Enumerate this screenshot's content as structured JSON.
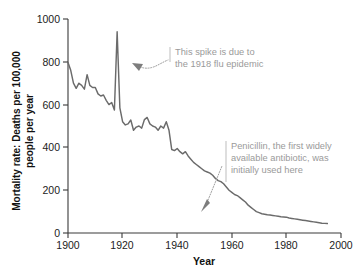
{
  "chart_data": {
    "type": "line",
    "title": "",
    "xlabel": "Year",
    "ylabel": "Mortality rate: Deaths per 100,000 people per year",
    "ylabel_line1": "Mortality rate: Deaths per 100,000",
    "ylabel_line2": "people per year",
    "xlim": [
      1900,
      2000
    ],
    "ylim": [
      0,
      1000
    ],
    "grid": false,
    "legend": "none",
    "line_color": "#6b6b6b",
    "axis_color": "#3a3a3a",
    "annotation_color": "#9a9a9a",
    "xticks": [
      1900,
      1920,
      1940,
      1960,
      1980,
      2000
    ],
    "xtick_labels": [
      "1900",
      "1920",
      "1940",
      "1960",
      "1980",
      "2000"
    ],
    "yticks": [
      0,
      200,
      400,
      600,
      800,
      1000
    ],
    "ytick_labels": [
      "0",
      "200",
      "400",
      "600",
      "800",
      "1000"
    ],
    "x": [
      1900,
      1901,
      1902,
      1903,
      1904,
      1905,
      1906,
      1907,
      1908,
      1909,
      1910,
      1911,
      1912,
      1913,
      1914,
      1915,
      1916,
      1917,
      1918,
      1919,
      1920,
      1921,
      1922,
      1923,
      1924,
      1925,
      1926,
      1927,
      1928,
      1929,
      1930,
      1931,
      1932,
      1933,
      1934,
      1935,
      1936,
      1937,
      1938,
      1939,
      1940,
      1941,
      1942,
      1943,
      1944,
      1945,
      1946,
      1947,
      1948,
      1949,
      1950,
      1951,
      1952,
      1953,
      1954,
      1955,
      1956,
      1957,
      1958,
      1959,
      1960,
      1961,
      1962,
      1963,
      1964,
      1965,
      1966,
      1967,
      1968,
      1969,
      1970,
      1971,
      1972,
      1973,
      1974,
      1975,
      1976,
      1977,
      1978,
      1979,
      1980,
      1981,
      1982,
      1983,
      1984,
      1985,
      1986,
      1987,
      1988,
      1989,
      1990,
      1991,
      1992,
      1993,
      1994,
      1995
    ],
    "values": [
      797,
      760,
      700,
      676,
      700,
      690,
      672,
      740,
      690,
      680,
      680,
      650,
      640,
      645,
      620,
      600,
      610,
      575,
      940,
      585,
      520,
      505,
      510,
      528,
      480,
      495,
      500,
      490,
      530,
      540,
      510,
      500,
      495,
      480,
      500,
      490,
      520,
      480,
      390,
      385,
      395,
      380,
      370,
      380,
      360,
      345,
      330,
      320,
      310,
      300,
      290,
      285,
      280,
      270,
      255,
      245,
      240,
      230,
      215,
      200,
      190,
      180,
      175,
      165,
      155,
      145,
      130,
      120,
      110,
      100,
      95,
      90,
      88,
      85,
      84,
      82,
      80,
      78,
      76,
      75,
      74,
      70,
      68,
      66,
      64,
      62,
      60,
      58,
      56,
      54,
      52,
      50,
      48,
      46,
      45,
      44
    ],
    "annotations": [
      {
        "id": "flu-spike-annotation",
        "line1": "This spike is due to",
        "line2": "the 1918 flu epidemic",
        "points_to_year": 1918,
        "points_to_value": 890
      },
      {
        "id": "penicillin-annotation",
        "line1": "Penicillin, the first widely",
        "line2": "available antibiotic, was",
        "line3": "initially used here",
        "points_to_year": 1949,
        "points_to_value": 130
      }
    ]
  }
}
